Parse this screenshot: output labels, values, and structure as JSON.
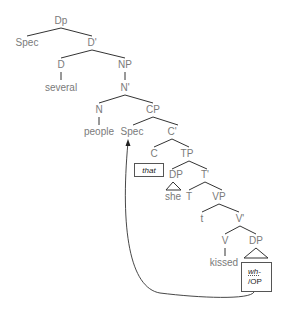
{
  "diagram": {
    "type": "syntax-tree",
    "colors": {
      "label": "#7a7a7a",
      "line": "#333333",
      "box_border": "#555555",
      "arrow": "#333333"
    },
    "nodes": {
      "dp_root": "Dp",
      "spec_top": "Spec",
      "d_bar": "D'",
      "d": "D",
      "several": "several",
      "np": "NP",
      "n_bar": "N'",
      "n": "N",
      "people": "people",
      "cp": "CP",
      "spec_cp": "Spec",
      "c_bar": "C'",
      "c": "C",
      "tp": "TP",
      "that": "that",
      "dp_subj": "DP",
      "she": "she",
      "t_bar": "T'",
      "t": "T",
      "vp": "VP",
      "t_trace": "t",
      "v_bar": "V'",
      "v": "V",
      "kissed": "kissed",
      "dp_obj": "DP",
      "wh_top": "wh-",
      "wh_bottom": "/OP"
    },
    "movement_arrow": {
      "from": "wh-/OP",
      "to": "Spec (CP)"
    }
  }
}
